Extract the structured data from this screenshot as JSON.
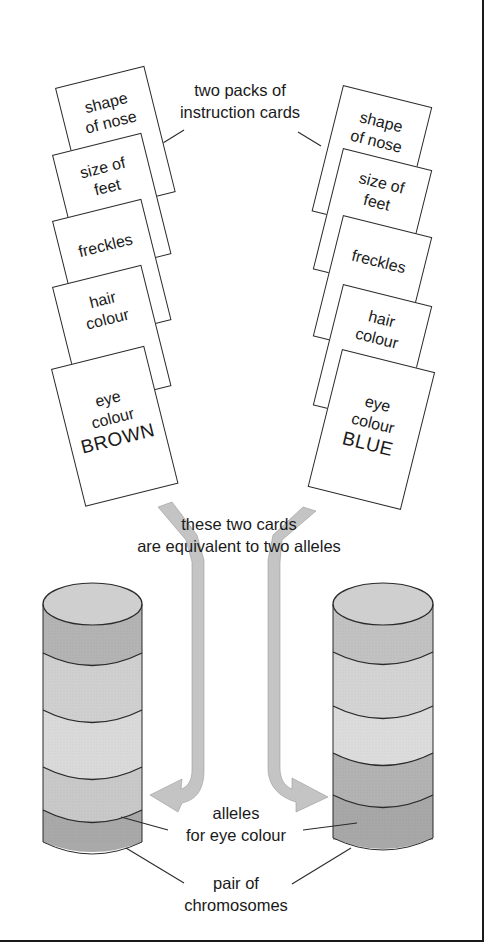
{
  "title_label": {
    "line1": "two packs of",
    "line2": "instruction cards"
  },
  "left_pack": {
    "cards": [
      {
        "line1": "shape",
        "line2": "of nose"
      },
      {
        "line1": "size of",
        "line2": "feet"
      },
      {
        "line1": "freckles",
        "line2": ""
      },
      {
        "line1": "hair",
        "line2": "colour"
      },
      {
        "line1": "eye",
        "line2": "colour",
        "line3": "BROWN"
      }
    ]
  },
  "right_pack": {
    "cards": [
      {
        "line1": "shape",
        "line2": "of nose"
      },
      {
        "line1": "size of",
        "line2": "feet"
      },
      {
        "line1": "freckles",
        "line2": ""
      },
      {
        "line1": "hair",
        "line2": "colour"
      },
      {
        "line1": "eye",
        "line2": "colour",
        "line3": "BLUE"
      }
    ]
  },
  "equivalence_label": {
    "line1": "these two cards",
    "line2": "are equivalent to two alleles"
  },
  "alleles_label": {
    "line1": "alleles",
    "line2": "for eye colour"
  },
  "chromosomes_label": {
    "line1": "pair of",
    "line2": "chromosomes"
  },
  "colors": {
    "ink": "#1a1a1a",
    "arrow_fill": "#c4c4c4",
    "band_dark": "#a8a8a8",
    "band_mid": "#bdbdbd",
    "band_light": "#d2d2d2",
    "band_lighter": "#dcdcdc"
  }
}
